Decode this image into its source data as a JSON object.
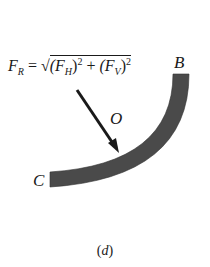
{
  "figure": {
    "caption_open": "(",
    "caption_letter": "d",
    "caption_close": ")",
    "labels": {
      "B": "B",
      "C": "C",
      "O": "O"
    },
    "formula": {
      "lhs": "F",
      "lhs_sub": "R",
      "equals": " = ",
      "sqrt": "√",
      "term1_open": "(F",
      "term1_sub": "H",
      "term1_close": ")",
      "exp1": "2",
      "plus": " + ",
      "term2_open": "(F",
      "term2_sub": "V",
      "term2_close": ")",
      "exp2": "2"
    },
    "colors": {
      "surface": "#4a4a4a",
      "arrow": "#1a1a1a"
    }
  }
}
